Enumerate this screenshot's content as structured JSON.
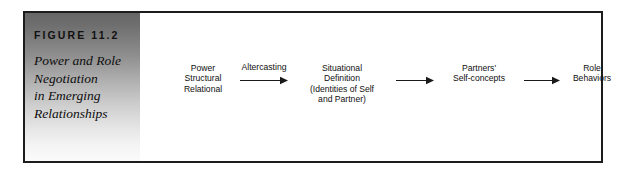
{
  "figure": {
    "number_label": "FIGURE 11.2",
    "title_lines": [
      "Power and Role",
      "Negotiation",
      "in Emerging",
      "Relationships"
    ],
    "panel_gradient_top": "#666666",
    "panel_gradient_bottom": "#fbfbfb",
    "frame_border_color": "#1c1c1c"
  },
  "diagram": {
    "type": "flow",
    "nodes": [
      {
        "id": "power",
        "lines": [
          "Power",
          "Structural",
          "Relational"
        ]
      },
      {
        "id": "situational",
        "lines": [
          "Situational",
          "Definition",
          "(Identities of Self",
          "and Partner)"
        ]
      },
      {
        "id": "partners",
        "lines": [
          "Partners'",
          "Self-concepts"
        ]
      },
      {
        "id": "role",
        "lines": [
          "Role",
          "Behaviors"
        ]
      }
    ],
    "arrows": [
      {
        "id": "arrow-1",
        "from": "power",
        "to": "situational",
        "label": "Altercasting"
      },
      {
        "id": "arrow-2",
        "from": "situational",
        "to": "partners",
        "label": ""
      },
      {
        "id": "arrow-3",
        "from": "partners",
        "to": "role",
        "label": ""
      }
    ],
    "arrow_color": "#1a1a1a",
    "text_color": "#0f0f0f"
  }
}
